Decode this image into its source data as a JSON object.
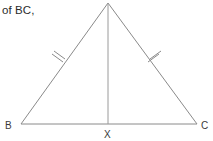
{
  "figure": {
    "caption_fragment": "of BC,",
    "shape": "isosceles-triangle-with-median",
    "stroke_color": "#8a8a8a",
    "text_color": "#2b2b2b",
    "background_color": "#ffffff",
    "vertices": [
      {
        "id": "A",
        "label": "",
        "x": 108,
        "y": 3,
        "role": "apex"
      },
      {
        "id": "B",
        "label": "B",
        "x": 21,
        "y": 124,
        "role": "base-left"
      },
      {
        "id": "C",
        "label": "C",
        "x": 197,
        "y": 124,
        "role": "base-right"
      },
      {
        "id": "X",
        "label": "X",
        "x": 108,
        "y": 124,
        "role": "base-midpoint"
      }
    ],
    "segments": [
      {
        "name": "side-AB",
        "from": "A",
        "to": "B",
        "tick_marks": 2
      },
      {
        "name": "side-AC",
        "from": "A",
        "to": "C",
        "tick_marks": 2
      },
      {
        "name": "base-BC",
        "from": "B",
        "to": "C",
        "tick_marks": 0
      },
      {
        "name": "median-AX",
        "from": "A",
        "to": "X",
        "tick_marks": 0
      }
    ],
    "tick_marks": [
      {
        "name": "tick-left",
        "cx": 58,
        "cy": 59,
        "count": 2
      },
      {
        "name": "tick-right",
        "cx": 154,
        "cy": 59,
        "count": 2
      }
    ]
  }
}
